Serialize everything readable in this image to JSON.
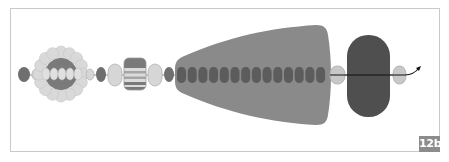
{
  "figure": {
    "label": "12b",
    "colors": {
      "background": "#ffffff",
      "frame_border": "#c9c9c9",
      "dark_bead": "#6f6f6f",
      "chain_bead": "#5c5c5c",
      "light_bead_fill": "#d6d6d6",
      "light_bead_stroke": "#b3b3b3",
      "petal_fill": "#d9d9d9",
      "cone_fill": "#8a8a8a",
      "pill_fill": "#4f4f4f",
      "stripe_dark": "#7a7a7a",
      "stripe_light": "#dcdcdc",
      "thread": "#111111",
      "badge_bg": "#8c8c8c",
      "badge_text": "#ffffff"
    },
    "elements": [
      {
        "type": "dark-bead",
        "x": 18,
        "y": 67,
        "w": 12,
        "h": 15
      },
      {
        "type": "light-bead",
        "x": 32,
        "y": 69,
        "w": 8,
        "h": 11
      },
      {
        "type": "flower-cluster",
        "cx": 61,
        "cy": 74,
        "petal_ring_radius": 22,
        "center_radius": 16
      },
      {
        "type": "light-bead",
        "x": 86,
        "y": 69,
        "w": 8,
        "h": 11
      },
      {
        "type": "dark-bead",
        "x": 96,
        "y": 67,
        "w": 10,
        "h": 15
      },
      {
        "type": "light-bead",
        "x": 108,
        "y": 64,
        "w": 14,
        "h": 22
      },
      {
        "type": "striped-box",
        "x": 124,
        "y": 58,
        "w": 22,
        "h": 32
      },
      {
        "type": "light-bead",
        "x": 148,
        "y": 64,
        "w": 14,
        "h": 22
      },
      {
        "type": "dark-bead",
        "x": 164,
        "y": 67,
        "w": 10,
        "h": 15
      },
      {
        "type": "cone",
        "x_left": 175,
        "x_right": 328,
        "left_half_height": 18,
        "right_half_height": 50,
        "cy": 75
      },
      {
        "type": "bead-chain",
        "x_start": 177,
        "x_end": 327,
        "count": 15,
        "cy": 75
      },
      {
        "type": "light-bead",
        "x": 330,
        "y": 66,
        "w": 15,
        "h": 18
      },
      {
        "type": "pill",
        "x": 347,
        "y": 35,
        "w": 43,
        "h": 82
      },
      {
        "type": "light-bead",
        "x": 393,
        "y": 66,
        "w": 13,
        "h": 18
      },
      {
        "type": "thread-arrow",
        "x_start": 330,
        "y": 75,
        "x_end": 420,
        "y_end": 68
      }
    ]
  }
}
